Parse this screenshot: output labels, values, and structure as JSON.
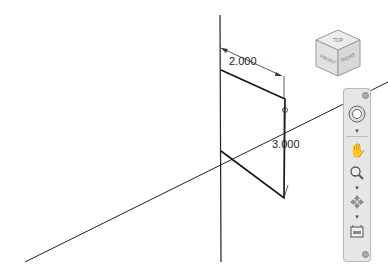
{
  "viewport": {
    "background": "#ffffff",
    "dimensions": [
      {
        "id": "width",
        "label": "2.000"
      },
      {
        "id": "height",
        "label": "3.000"
      }
    ]
  },
  "viewcube": {
    "faces": {
      "top": "TOP",
      "front": "FRONT",
      "right": "RIGHT"
    }
  },
  "navigation_bar": {
    "tools": [
      {
        "name": "steering-wheel",
        "icon": "steering-wheel-icon"
      },
      {
        "name": "pan",
        "icon": "hand-icon"
      },
      {
        "name": "zoom",
        "icon": "zoom-icon"
      },
      {
        "name": "orbit",
        "icon": "orbit-icon"
      },
      {
        "name": "showmotion",
        "icon": "showmotion-icon"
      }
    ]
  }
}
